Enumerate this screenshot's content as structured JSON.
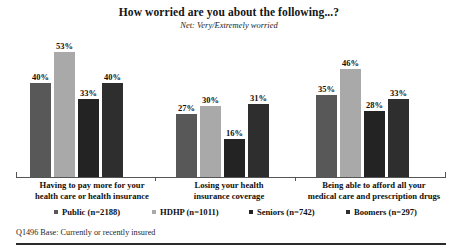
{
  "chart_data": {
    "type": "bar",
    "title": "How worried are you about the following...?",
    "subtitle": "Net: Very/Extremely worried",
    "xlabel": "",
    "ylabel": "",
    "ylim": [
      0,
      60
    ],
    "grid": false,
    "legend_position": "bottom",
    "value_suffix": "%",
    "categories": [
      "Having to pay more for your health care or health insurance",
      "Losing your health insurance coverage",
      "Being able to afford all your medical care and prescription drugs"
    ],
    "category_lines": [
      [
        "Having to pay more for your",
        "health care or health insurance"
      ],
      [
        "Losing your health",
        "insurance coverage"
      ],
      [
        "Being able to afford all your",
        "medical care and prescription drugs"
      ]
    ],
    "series": [
      {
        "name": "Public",
        "legend_label": "Public (n=2188)",
        "n": 2188,
        "color": "#585858",
        "values": [
          40,
          27,
          35
        ],
        "labels": [
          "40%",
          "27%",
          "35%"
        ]
      },
      {
        "name": "HDHP",
        "legend_label": "HDHP (n=1011)",
        "n": 1011,
        "color": "#a9a9a9",
        "values": [
          53,
          30,
          46
        ],
        "labels": [
          "53%",
          "30%",
          "46%"
        ]
      },
      {
        "name": "Seniors",
        "legend_label": "Seniors (n=742)",
        "n": 742,
        "color": "#232323",
        "values": [
          33,
          16,
          28
        ],
        "labels": [
          "33%",
          "16%",
          "28%"
        ]
      },
      {
        "name": "Boomers",
        "legend_label": "Boomers (n=297)",
        "n": 297,
        "color": "#2e2e2e",
        "values": [
          40,
          31,
          33
        ],
        "labels": [
          "40%",
          "31%",
          "33%"
        ]
      }
    ]
  },
  "footer": {
    "note": "Q1496 Base: Currently or recently insured"
  }
}
